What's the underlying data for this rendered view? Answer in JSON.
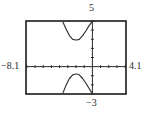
{
  "chart_data": {
    "type": "line",
    "title": "",
    "xlabel": "",
    "ylabel": "",
    "window": {
      "xmin": -8.1,
      "xmax": 4.1,
      "ymin": -3,
      "ymax": 5,
      "xscl": 1,
      "yscl": 1
    },
    "xlim": [
      -8.1,
      4.1
    ],
    "ylim": [
      -3,
      5
    ],
    "grid": false,
    "legend": null,
    "tick_labels": {
      "xmin": "−8.1",
      "xmax": "4.1",
      "ymax": "5",
      "ymin": "−3"
    },
    "series": [
      {
        "name": "upper branch",
        "x": [
          -3.6,
          -3.2,
          -2.8,
          -2.4,
          -2.0,
          -1.9,
          -1.6,
          -1.2,
          -0.8,
          -0.4,
          -0.05
        ],
        "y": [
          4.9,
          4.1,
          3.4,
          3.0,
          2.92,
          2.92,
          3.0,
          3.4,
          3.9,
          4.5,
          4.9
        ]
      },
      {
        "name": "lower branch",
        "x": [
          -3.6,
          -3.2,
          -2.8,
          -2.4,
          -2.0,
          -1.9,
          -1.6,
          -1.2,
          -0.8,
          -0.4,
          -0.05
        ],
        "y": [
          -2.9,
          -2.0,
          -1.3,
          -0.9,
          -0.81,
          -0.81,
          -0.9,
          -1.3,
          -1.8,
          -2.4,
          -2.9
        ]
      }
    ],
    "colors": {
      "frame": "#1a1a1a",
      "axis": "#2a2a2a",
      "curve": "#333333"
    }
  },
  "labels": {
    "ymax": "5",
    "ymin": "−3",
    "xmin": "−8.1",
    "xmax": "4.1"
  }
}
